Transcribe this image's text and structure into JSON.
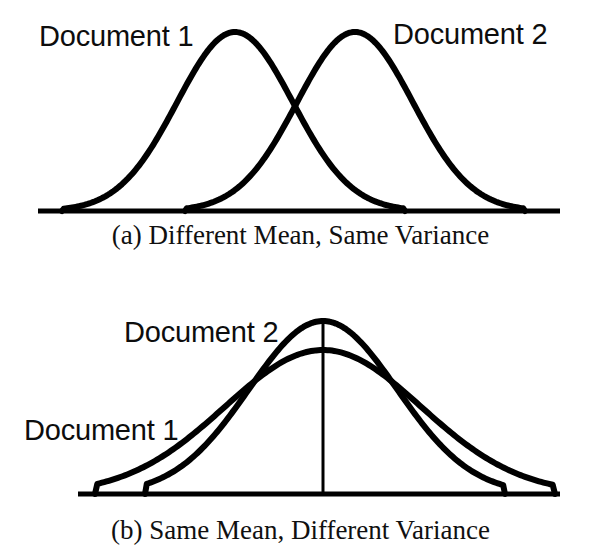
{
  "figure": {
    "background_color": "#ffffff",
    "stroke_color": "#000000",
    "width": 601,
    "height": 557
  },
  "panels": [
    {
      "id": "a",
      "caption": "(a) Different Mean, Same Variance",
      "labels": {
        "doc1": "Document 1",
        "doc2": "Document 2"
      }
    },
    {
      "id": "b",
      "caption": "(b) Same Mean, Different Variance",
      "labels": {
        "doc1": "Document 1",
        "doc2": "Document 2"
      }
    }
  ],
  "chart_data": [
    {
      "type": "line",
      "title": "(a) Different Mean, Same Variance",
      "subtitle": "",
      "xlabel": "",
      "ylabel": "",
      "grid": false,
      "legend_position": "inline-annotations",
      "axis": {
        "baseline_only": true,
        "baseline_y_px": 211,
        "x_start_px": 38,
        "x_end_px": 560,
        "xlim": [
          0,
          601
        ],
        "ylim": [
          0,
          1
        ]
      },
      "series": [
        {
          "name": "Document 1",
          "distribution": "gaussian",
          "mean_px": 235,
          "sigma_px": 58,
          "peak_y_px": 32,
          "left_tail_px": 62,
          "right_tail_px": 405,
          "x": [
            62,
            90,
            120,
            150,
            180,
            206,
            235,
            264,
            290,
            320,
            350,
            380,
            405
          ],
          "y": [
            0.0,
            0.02,
            0.09,
            0.26,
            0.54,
            0.82,
            1.0,
            0.82,
            0.54,
            0.26,
            0.09,
            0.02,
            0.0
          ]
        },
        {
          "name": "Document 2",
          "distribution": "gaussian",
          "mean_px": 355,
          "sigma_px": 58,
          "peak_y_px": 32,
          "left_tail_px": 185,
          "right_tail_px": 525,
          "x": [
            185,
            212,
            242,
            272,
            300,
            326,
            355,
            384,
            410,
            440,
            470,
            500,
            525
          ],
          "y": [
            0.0,
            0.02,
            0.09,
            0.26,
            0.54,
            0.82,
            1.0,
            0.82,
            0.54,
            0.26,
            0.09,
            0.02,
            0.0
          ]
        }
      ],
      "annotations": [
        {
          "text": "Document 1",
          "x_px": 39,
          "y_px": 22
        },
        {
          "text": "Document 2",
          "x_px": 393,
          "y_px": 20
        }
      ],
      "intersection_px": {
        "x": 297,
        "y": 92
      }
    },
    {
      "type": "line",
      "title": "(b) Same Mean, Different Variance",
      "subtitle": "",
      "xlabel": "",
      "ylabel": "",
      "grid": false,
      "legend_position": "inline-annotations",
      "axis": {
        "baseline_only": true,
        "baseline_y_px": 494,
        "x_start_px": 78,
        "x_end_px": 560,
        "center_line_x_px": 323,
        "xlim": [
          0,
          601
        ],
        "ylim": [
          0,
          1
        ]
      },
      "series": [
        {
          "name": "Document 1",
          "distribution": "gaussian",
          "mean_px": 323,
          "sigma_px": 98,
          "peak_y_px": 350,
          "left_tail_px": 95,
          "right_tail_px": 555,
          "x": [
            95,
            130,
            170,
            210,
            250,
            290,
            323,
            356,
            396,
            436,
            476,
            516,
            555
          ],
          "y": [
            0.0,
            0.06,
            0.19,
            0.4,
            0.65,
            0.9,
            1.0,
            0.9,
            0.65,
            0.4,
            0.19,
            0.06,
            0.0
          ]
        },
        {
          "name": "Document 2",
          "distribution": "gaussian",
          "mean_px": 323,
          "sigma_px": 74,
          "peak_y_px": 321,
          "left_tail_px": 145,
          "right_tail_px": 505,
          "x": [
            145,
            175,
            205,
            235,
            265,
            295,
            323,
            351,
            381,
            411,
            441,
            475,
            505
          ],
          "y": [
            0.0,
            0.05,
            0.16,
            0.37,
            0.64,
            0.9,
            1.0,
            0.9,
            0.64,
            0.37,
            0.16,
            0.05,
            0.0
          ]
        }
      ],
      "annotations": [
        {
          "text": "Document 2",
          "x_px": 124,
          "y_px": 318
        },
        {
          "text": "Document 1",
          "x_px": 24,
          "y_px": 416
        }
      ]
    }
  ]
}
